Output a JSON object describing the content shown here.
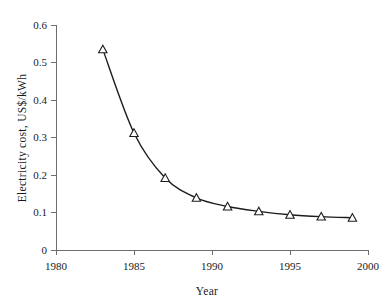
{
  "chart_data": {
    "type": "line",
    "title": "",
    "subtitle": "",
    "xlabel": "Year",
    "ylabel": "Electricity cost,  US$/kWh",
    "xlim": [
      1980,
      2000
    ],
    "ylim": [
      0,
      0.6
    ],
    "grid": false,
    "legend": null,
    "marker": "open-triangle",
    "x": [
      1983,
      1985,
      1987,
      1989,
      1991,
      1993,
      1995,
      1997,
      1999
    ],
    "values": [
      0.535,
      0.312,
      0.192,
      0.139,
      0.116,
      0.103,
      0.094,
      0.089,
      0.086
    ],
    "series": [
      {
        "name": "Electricity cost",
        "x": [
          1983,
          1985,
          1987,
          1989,
          1991,
          1993,
          1995,
          1997,
          1999
        ],
        "values": [
          0.535,
          0.312,
          0.192,
          0.139,
          0.116,
          0.103,
          0.094,
          0.089,
          0.086
        ]
      }
    ],
    "xticks": [
      1980,
      1985,
      1990,
      1995,
      2000
    ],
    "xtick_labels": [
      "1980",
      "1985",
      "1990",
      "1995",
      "2000"
    ],
    "yticks": [
      0,
      0.1,
      0.2,
      0.3,
      0.4,
      0.5,
      0.6
    ],
    "ytick_labels": [
      "0",
      "0.1",
      "0.2",
      "0.3",
      "0.4",
      "0.5",
      "0.6"
    ],
    "annotations": []
  },
  "axes": {
    "y_title": "Electricity cost,  US$/kWh",
    "x_title": "Year",
    "y_labels": {
      "t0": "0.6",
      "t1": "0.5",
      "t2": "0.4",
      "t3": "0.3",
      "t4": "0.2",
      "t5": "0.1",
      "t6": "0"
    },
    "x_labels": {
      "t0": "1980",
      "t1": "1985",
      "t2": "1990",
      "t3": "1995",
      "t4": "2000"
    }
  },
  "colors": {
    "background": "#ffffff",
    "axis": "#6d6d6d",
    "line": "#1c1c1c",
    "marker_fill": "#ffffff",
    "text": "#1a1a1a"
  }
}
